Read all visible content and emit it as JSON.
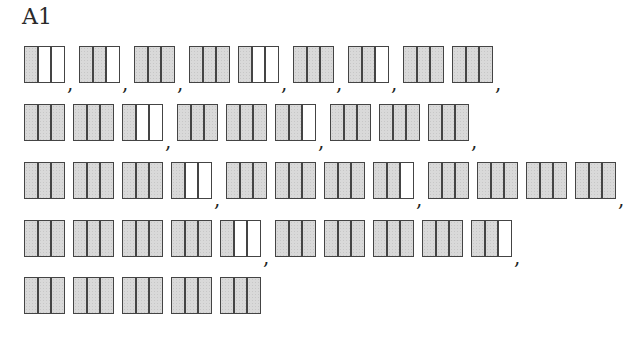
{
  "title": "A1",
  "colors": {
    "shaded": "#d9d9d9",
    "border": "#444444",
    "background": "#ffffff"
  },
  "parts_per_box": 3,
  "separator": ",",
  "rows": [
    {
      "groups": [
        [
          1
        ],
        [
          2
        ],
        [
          3
        ],
        [
          3,
          1
        ],
        [
          3
        ],
        [
          2
        ],
        [
          3,
          3
        ]
      ]
    },
    {
      "groups": [
        [
          3,
          3,
          1
        ],
        [
          3,
          3,
          2
        ],
        [
          3,
          3,
          3
        ]
      ]
    },
    {
      "groups": [
        [
          3,
          3,
          3,
          1
        ],
        [
          3,
          3,
          3,
          2
        ],
        [
          3,
          3,
          3,
          3
        ]
      ]
    },
    {
      "groups": [
        [
          3,
          3,
          3,
          3,
          1
        ],
        [
          3,
          3,
          3,
          3,
          2
        ]
      ]
    },
    {
      "groups": [
        [
          3,
          3,
          3,
          3,
          3
        ]
      ],
      "trailing_separator": false
    }
  ]
}
